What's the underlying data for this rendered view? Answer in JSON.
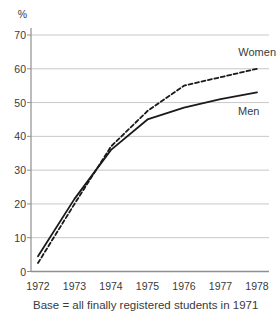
{
  "colors": {
    "grid": "#c8c8c8",
    "axis": "#8f8f8f",
    "text": "#3a3a3a",
    "line": "#1a1a1a",
    "background": "#ffffff"
  },
  "chart_data": {
    "type": "line",
    "title": "",
    "unit_label": "%",
    "xlabel": "",
    "ylabel": "%",
    "x": [
      1972,
      1973,
      1974,
      1975,
      1976,
      1977,
      1978
    ],
    "x_labels": [
      "1972",
      "1973",
      "1974",
      "1975",
      "1976",
      "1977",
      "1978"
    ],
    "y_ticks": [
      0,
      10,
      20,
      30,
      40,
      50,
      60,
      70
    ],
    "ylim": [
      0,
      70
    ],
    "grid": true,
    "legend_position": "inline-right",
    "series": [
      {
        "name": "Women",
        "style": "dashed",
        "color": "#1a1a1a",
        "values": [
          2.5,
          20,
          37,
          47.5,
          55,
          57.5,
          60
        ]
      },
      {
        "name": "Men",
        "style": "solid",
        "color": "#1a1a1a",
        "values": [
          4.5,
          21.5,
          36,
          45,
          48.5,
          51,
          53
        ]
      }
    ],
    "caption": "Base = all finally registered students in 1971"
  }
}
